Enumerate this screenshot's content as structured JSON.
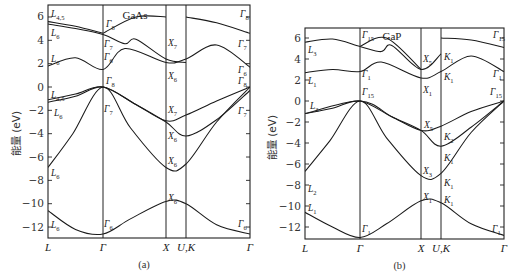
{
  "figure": {
    "ylabel": "能量 (eV)",
    "panels": [
      {
        "id": "a",
        "caption": "(a)",
        "material": "GaAs",
        "frame": {
          "x0": 48,
          "x1": 250,
          "y_top": 5,
          "y_bottom": 238
        },
        "y_map": {
          "zero_px": 87,
          "px_per_eV": 11.67
        },
        "k_points": [
          {
            "label": "L",
            "x": 48
          },
          {
            "label": "Γ",
            "x": 103
          },
          {
            "label": "X",
            "x": 166
          },
          {
            "label": "U,K",
            "x": 186
          },
          {
            "label": "Γ",
            "x": 250
          }
        ],
        "y_ticks": [
          6,
          4,
          2,
          0,
          -2,
          -4,
          -6,
          -8,
          -10,
          -12
        ],
        "symmetry_labels": [
          {
            "t": "L",
            "s": "4,5",
            "x": 51,
            "y": 17
          },
          {
            "t": "L",
            "s": "6",
            "x": 51,
            "y": 36
          },
          {
            "t": "L",
            "s": "6",
            "x": 51,
            "y": 62
          },
          {
            "t": "L",
            "s": "4,5",
            "x": 51,
            "y": 98
          },
          {
            "t": "L",
            "s": "6",
            "x": 54,
            "y": 116
          },
          {
            "t": "L",
            "s": "6",
            "x": 51,
            "y": 176
          },
          {
            "t": "L",
            "s": "6",
            "x": 51,
            "y": 228
          },
          {
            "t": "Γ",
            "s": "8",
            "x": 106,
            "y": 27
          },
          {
            "t": "Γ",
            "s": "7",
            "x": 104,
            "y": 47
          },
          {
            "t": "Γ",
            "s": "6",
            "x": 104,
            "y": 60
          },
          {
            "t": "Γ",
            "s": "8",
            "x": 106,
            "y": 84
          },
          {
            "t": "Γ",
            "s": "7",
            "x": 104,
            "y": 112
          },
          {
            "t": "Γ",
            "s": "6",
            "x": 104,
            "y": 227
          },
          {
            "t": "X",
            "s": "7",
            "x": 168,
            "y": 46
          },
          {
            "t": "X",
            "s": "6",
            "x": 168,
            "y": 79
          },
          {
            "t": "X",
            "s": "7",
            "x": 168,
            "y": 113
          },
          {
            "t": "X",
            "s": "6",
            "x": 168,
            "y": 139
          },
          {
            "t": "X",
            "s": "6",
            "x": 168,
            "y": 164
          },
          {
            "t": "X",
            "s": "6",
            "x": 168,
            "y": 201
          },
          {
            "t": "Γ",
            "s": "8",
            "x": 240,
            "y": 17
          },
          {
            "t": "Γ",
            "s": "7",
            "x": 238,
            "y": 47
          },
          {
            "t": "Γ",
            "s": "6",
            "x": 238,
            "y": 73
          },
          {
            "t": "Γ",
            "s": "8",
            "x": 238,
            "y": 84
          },
          {
            "t": "Γ",
            "s": "7",
            "x": 238,
            "y": 114
          },
          {
            "t": "Γ",
            "s": "6",
            "x": 238,
            "y": 227
          }
        ]
      },
      {
        "id": "b",
        "caption": "(b)",
        "material": "GaP",
        "frame": {
          "x0": 305,
          "x1": 504,
          "y_top": 28,
          "y_bottom": 239
        },
        "y_map": {
          "zero_px": 101,
          "px_per_eV": 10.5
        },
        "k_points": [
          {
            "label": "L",
            "x": 305
          },
          {
            "label": "Γ",
            "x": 360
          },
          {
            "label": "X",
            "x": 421
          },
          {
            "label": "U,K",
            "x": 441
          },
          {
            "label": "Γ",
            "x": 504
          }
        ],
        "y_ticks": [
          6,
          4,
          2,
          0,
          -2,
          -4,
          -6,
          -8,
          -10,
          -12
        ],
        "symmetry_labels": [
          {
            "t": "L",
            "s": "3",
            "x": 308,
            "y": 53
          },
          {
            "t": "L",
            "s": "1",
            "x": 308,
            "y": 84
          },
          {
            "t": "L",
            "s": "3",
            "x": 310,
            "y": 109
          },
          {
            "t": "L",
            "s": "2",
            "x": 308,
            "y": 192
          },
          {
            "t": "L",
            "s": "1",
            "x": 308,
            "y": 211
          },
          {
            "t": "Γ",
            "s": "15",
            "x": 362,
            "y": 38
          },
          {
            "t": "Γ",
            "s": "1",
            "x": 362,
            "y": 77
          },
          {
            "t": "Γ",
            "s": "15",
            "x": 362,
            "y": 95
          },
          {
            "t": "Γ",
            "s": "1",
            "x": 362,
            "y": 232
          },
          {
            "t": "X",
            "s": "5",
            "x": 423,
            "y": 62
          },
          {
            "t": "X",
            "s": "1",
            "x": 423,
            "y": 93
          },
          {
            "t": "X",
            "s": "5",
            "x": 424,
            "y": 128
          },
          {
            "t": "X",
            "s": "3",
            "x": 423,
            "y": 174
          },
          {
            "t": "X",
            "s": "1",
            "x": 423,
            "y": 200
          },
          {
            "t": "K",
            "s": "1",
            "x": 444,
            "y": 60
          },
          {
            "t": "K",
            "s": "1",
            "x": 444,
            "y": 80
          },
          {
            "t": "K",
            "s": "2",
            "x": 444,
            "y": 140
          },
          {
            "t": "K",
            "s": "1",
            "x": 444,
            "y": 161
          },
          {
            "t": "K",
            "s": "1",
            "x": 444,
            "y": 186
          },
          {
            "t": "K",
            "s": "1",
            "x": 444,
            "y": 203
          },
          {
            "t": "Γ",
            "s": "15",
            "x": 493,
            "y": 38
          },
          {
            "t": "Γ",
            "s": "1",
            "x": 493,
            "y": 77
          },
          {
            "t": "Γ",
            "s": "15",
            "x": 490,
            "y": 95
          },
          {
            "t": "Γ",
            "s": "1",
            "x": 492,
            "y": 232
          }
        ]
      }
    ]
  },
  "chart_data": [
    {
      "type": "line",
      "title": "GaAs",
      "caption": "(a)",
      "xlabel": "",
      "ylabel": "能量 (eV)",
      "x_ticks": [
        "L",
        "Γ",
        "X",
        "U,K",
        "Γ"
      ],
      "ylim": [
        -13,
        7
      ],
      "y_ticks": [
        6,
        4,
        2,
        0,
        -2,
        -4,
        -6,
        -8,
        -10,
        -12
      ],
      "grid": false,
      "series": [
        {
          "name": "band1",
          "points": [
            [
              0,
              -10.6
            ],
            [
              0.5,
              -12.2
            ],
            [
              1,
              -12.6
            ],
            [
              1.5,
              -11.3
            ],
            [
              2.15,
              -9.8
            ],
            [
              2.45,
              -10.0
            ],
            [
              3,
              -11.8
            ],
            [
              3.6,
              -12.6
            ]
          ]
        },
        {
          "name": "band2",
          "points": [
            [
              0,
              -6.9
            ],
            [
              0.45,
              -4.0
            ],
            [
              1,
              0.0
            ],
            [
              1.5,
              -3.5
            ],
            [
              2.15,
              -6.9
            ],
            [
              2.45,
              -6.6
            ],
            [
              3,
              -3.0
            ],
            [
              3.6,
              0.0
            ]
          ]
        },
        {
          "name": "band3",
          "points": [
            [
              0,
              -1.3
            ],
            [
              0.5,
              -0.8
            ],
            [
              1,
              0.0
            ],
            [
              1.6,
              -1.5
            ],
            [
              2.15,
              -3.0
            ],
            [
              2.45,
              -4.2
            ],
            [
              3,
              -2.8
            ],
            [
              3.6,
              -0.3
            ]
          ]
        },
        {
          "name": "band4",
          "points": [
            [
              0,
              -1.1
            ],
            [
              0.5,
              -0.6
            ],
            [
              1,
              0.0
            ],
            [
              1.6,
              -1.5
            ],
            [
              2.15,
              -2.9
            ],
            [
              2.45,
              -2.4
            ],
            [
              3,
              -1.2
            ],
            [
              3.6,
              0.0
            ]
          ]
        },
        {
          "name": "band5",
          "points": [
            [
              0,
              1.8
            ],
            [
              0.5,
              2.5
            ],
            [
              1,
              1.5
            ],
            [
              1.4,
              3.3
            ],
            [
              2.15,
              2.1
            ],
            [
              2.45,
              2.4
            ],
            [
              3,
              3.6
            ],
            [
              3.6,
              1.7
            ]
          ]
        },
        {
          "name": "band6",
          "points": [
            [
              0,
              5.4
            ],
            [
              0.5,
              5.0
            ],
            [
              1,
              4.5
            ],
            [
              1.4,
              3.7
            ],
            [
              1.6,
              4.1
            ],
            [
              2.15,
              2.4
            ],
            [
              2.45,
              2.1
            ]
          ]
        },
        {
          "name": "band7",
          "points": [
            [
              0,
              5.6
            ],
            [
              0.5,
              5.2
            ],
            [
              1,
              4.6
            ]
          ]
        },
        {
          "name": "band8",
          "points": [
            [
              1,
              4.6
            ],
            [
              1.6,
              6.0
            ],
            [
              2.15,
              6.0
            ]
          ]
        },
        {
          "name": "band9",
          "points": [
            [
              2.45,
              6.0
            ],
            [
              3,
              5.5
            ],
            [
              3.6,
              4.6
            ]
          ]
        }
      ]
    },
    {
      "type": "line",
      "title": "GaP",
      "caption": "(b)",
      "xlabel": "",
      "ylabel": "能量 (eV)",
      "x_ticks": [
        "L",
        "Γ",
        "X",
        "U,K",
        "Γ"
      ],
      "ylim": [
        -13,
        7
      ],
      "y_ticks": [
        6,
        4,
        2,
        0,
        -2,
        -4,
        -6,
        -8,
        -10,
        -12
      ],
      "grid": false,
      "series": [
        {
          "name": "band1",
          "points": [
            [
              0,
              -10.6
            ],
            [
              0.5,
              -12.0
            ],
            [
              1,
              -13.0
            ],
            [
              1.5,
              -11.7
            ],
            [
              2.15,
              -9.5
            ],
            [
              2.45,
              -9.7
            ],
            [
              3,
              -11.7
            ],
            [
              3.6,
              -12.8
            ]
          ]
        },
        {
          "name": "band2",
          "points": [
            [
              0,
              -6.7
            ],
            [
              0.45,
              -3.8
            ],
            [
              1,
              0.0
            ],
            [
              1.5,
              -3.5
            ],
            [
              2.15,
              -7.1
            ],
            [
              2.45,
              -6.9
            ],
            [
              3,
              -3.0
            ],
            [
              3.6,
              0.0
            ]
          ]
        },
        {
          "name": "band3",
          "points": [
            [
              0,
              -1.2
            ],
            [
              0.5,
              -0.7
            ],
            [
              1,
              0.0
            ],
            [
              1.6,
              -1.5
            ],
            [
              2.15,
              -2.8
            ],
            [
              2.45,
              -4.3
            ],
            [
              3,
              -2.5
            ],
            [
              3.6,
              0.0
            ]
          ]
        },
        {
          "name": "band4",
          "points": [
            [
              0,
              -1.2
            ],
            [
              1,
              0.0
            ],
            [
              1.6,
              -1.5
            ],
            [
              2.15,
              -2.8
            ],
            [
              2.45,
              -2.4
            ],
            [
              3,
              -1.0
            ],
            [
              3.6,
              0.0
            ]
          ]
        },
        {
          "name": "band5",
          "points": [
            [
              0,
              2.7
            ],
            [
              0.5,
              3.0
            ],
            [
              1,
              2.8
            ],
            [
              1.4,
              3.7
            ],
            [
              2.15,
              2.2
            ],
            [
              2.45,
              2.8
            ],
            [
              3,
              4.3
            ],
            [
              3.6,
              2.8
            ]
          ]
        },
        {
          "name": "band6",
          "points": [
            [
              0,
              5.6
            ],
            [
              0.5,
              5.9
            ],
            [
              1,
              5.2
            ],
            [
              1.4,
              4.7
            ],
            [
              1.6,
              5.3
            ],
            [
              2.15,
              3.0
            ],
            [
              2.45,
              4.5
            ]
          ]
        },
        {
          "name": "band7",
          "points": [
            [
              1,
              5.2
            ],
            [
              1.5,
              6.0
            ],
            [
              2.15,
              3.0
            ]
          ]
        },
        {
          "name": "band8",
          "points": [
            [
              2.45,
              6.0
            ],
            [
              3,
              5.8
            ],
            [
              3.6,
              5.1
            ]
          ]
        }
      ]
    }
  ]
}
